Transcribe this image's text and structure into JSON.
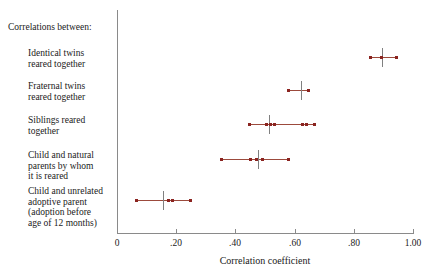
{
  "chart_data": {
    "type": "scatter",
    "title": "",
    "xlabel": "Correlation coefficient",
    "ylabel": "",
    "xlim": [
      0,
      1.0
    ],
    "grid": false,
    "legend": "none",
    "header": "Correlations between:",
    "xticks": [
      "0",
      ".20",
      ".40",
      ".60",
      ".80",
      "1.00"
    ],
    "xtick_values": [
      0,
      0.2,
      0.4,
      0.6,
      0.8,
      1.0
    ],
    "rows": [
      {
        "label_lines": [
          "Identical twins",
          "reared together"
        ],
        "range": [
          0.855,
          0.945
        ],
        "mean": 0.895,
        "points": [
          0.855,
          0.895,
          0.945
        ]
      },
      {
        "label_lines": [
          "Fraternal twins",
          "reared together"
        ],
        "range": [
          0.575,
          0.65
        ],
        "mean": 0.62,
        "points": [
          0.578,
          0.648
        ]
      },
      {
        "label_lines": [
          "Siblings reared",
          "together"
        ],
        "range": [
          0.445,
          0.672
        ],
        "mean": 0.515,
        "points": [
          0.447,
          0.505,
          0.52,
          0.532,
          0.625,
          0.64,
          0.668
        ]
      },
      {
        "label_lines": [
          "Child and natural",
          "parents by whom",
          "it is reared"
        ],
        "range": [
          0.35,
          0.583
        ],
        "mean": 0.478,
        "points": [
          0.352,
          0.452,
          0.472,
          0.49,
          0.58
        ]
      },
      {
        "label_lines": [
          "Child and unrelated",
          "adoptive parent",
          "(adoption before",
          "age of 12 months)"
        ],
        "range": [
          0.063,
          0.25
        ],
        "mean": 0.157,
        "points": [
          0.065,
          0.173,
          0.188,
          0.248
        ]
      }
    ]
  },
  "colors": {
    "dot": "#8b2420",
    "range_line": "#9c4a3c",
    "axis": "#8a8a8a",
    "mean_tick": "#808080",
    "text": "#1a1a1a",
    "background": "#ffffff"
  }
}
